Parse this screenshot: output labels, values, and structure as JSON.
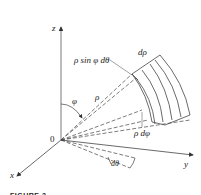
{
  "figure": {
    "caption": "FIGURE 3",
    "axes": {
      "z": "z",
      "y": "y",
      "x": "x",
      "origin": "0"
    },
    "labels": {
      "rho_sin_phi_dtheta": "ρ sin φ dθ",
      "drho": "dρ",
      "rho": "ρ",
      "phi": "φ",
      "rho_dphi": "ρ dφ",
      "dtheta": "dθ"
    },
    "colors": {
      "line": "#333333",
      "background": "#ffffff"
    }
  }
}
